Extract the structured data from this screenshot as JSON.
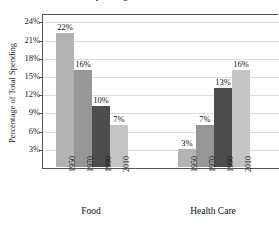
{
  "chart_data": {
    "type": "bar",
    "title": "Consumer Spending on Food and Health Care",
    "xlabel": "",
    "ylabel": "Percentage of Total Spending",
    "ylim": [
      0,
      24
    ],
    "yticks": [
      "3%",
      "6%",
      "9%",
      "12%",
      "15%",
      "18%",
      "21%",
      "24%"
    ],
    "ytick_values": [
      3,
      6,
      9,
      12,
      15,
      18,
      21,
      24
    ],
    "grid": true,
    "legend": "none",
    "categories": [
      "1950",
      "1970",
      "1990",
      "2010"
    ],
    "groups": [
      "Food",
      "Health Care"
    ],
    "series": [
      {
        "name": "Food",
        "values": [
          22,
          16,
          10,
          7
        ],
        "labels": [
          "22%",
          "16%",
          "10%",
          "7%"
        ]
      },
      {
        "name": "Health Care",
        "values": [
          3,
          7,
          13,
          16
        ],
        "labels": [
          "3%",
          "7%",
          "13%",
          "16%"
        ]
      }
    ],
    "bar_colors": [
      "#b3b3b3",
      "#969696",
      "#4d4d4d",
      "#c4c4c4"
    ],
    "axis_color": "#555555",
    "grid_color": "#dcdcdc",
    "background": "#ffffff"
  }
}
